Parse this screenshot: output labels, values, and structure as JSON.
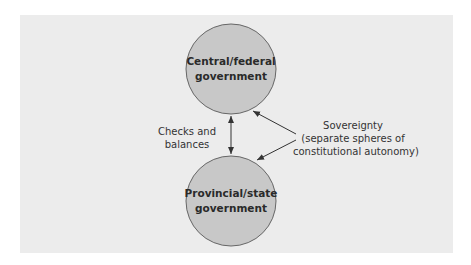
{
  "diagram": {
    "nodes": [
      {
        "id": "central",
        "line1": "Central/federal",
        "line2": "government"
      },
      {
        "id": "provincial",
        "line1": "Provincial/state",
        "line2": "government"
      }
    ],
    "edges": [
      {
        "from": "central",
        "to": "provincial",
        "type": "bidirectional",
        "label_line1": "Checks and",
        "label_line2": "balances"
      }
    ],
    "annotation": {
      "line1": "Sovereignty",
      "line2": "(separate spheres of",
      "line3": "constitutional autonomy)",
      "points_to": [
        "central",
        "provincial"
      ]
    },
    "colors": {
      "background": "#ececec",
      "node_fill": "#c8c8c8",
      "node_stroke": "#666666",
      "arrow": "#333333"
    }
  }
}
